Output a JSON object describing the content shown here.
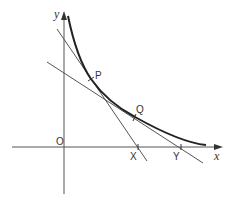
{
  "diagram": {
    "type": "graph-tangents",
    "axes": {
      "x_label": "x",
      "y_label": "y",
      "origin_label": "O"
    },
    "points": {
      "P": "P",
      "Q": "Q",
      "X": "X",
      "Y": "Y"
    },
    "colors": {
      "curve": "#222222",
      "lines": "#555555",
      "axes": "#555555",
      "text": "#333333"
    }
  }
}
